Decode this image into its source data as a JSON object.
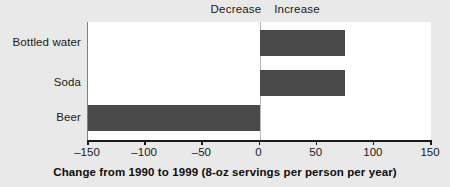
{
  "chart_data": {
    "type": "bar",
    "orientation": "horizontal",
    "title": "",
    "xlabel": "Change from 1990 to 1999 (8-oz servings per person per year)",
    "ylabel": "",
    "categories": [
      "Bottled water",
      "Soda",
      "Beer"
    ],
    "values": [
      75,
      75,
      -150
    ],
    "series": [
      {
        "name": "Change from 1990 to 1999",
        "values": [
          75,
          75,
          -150
        ]
      }
    ],
    "xlim": [
      -150,
      150
    ],
    "xticks": [
      -150,
      -100,
      -50,
      0,
      50,
      100,
      150
    ],
    "xtick_labels": [
      "–150",
      "–100",
      "–50",
      "0",
      "50",
      "100",
      "150"
    ],
    "grid": false,
    "legend": false,
    "annotations": [
      {
        "text": "Decrease",
        "side": "left",
        "position": "top"
      },
      {
        "text": "Increase",
        "side": "right",
        "position": "top"
      }
    ],
    "zero_reference_line": 0,
    "colors": {
      "bar": "#4a4a4a",
      "plot_background": "#ffffff",
      "figure_background": "#e9e9e9",
      "axis": "#1a1a1a",
      "zero_line": "#b9b9b9",
      "text": "#1a1a1a"
    }
  },
  "annotations": {
    "decrease": "Decrease",
    "increase": "Increase"
  },
  "axis": {
    "title": "Change from 1990 to 1999 (8-oz servings per person per year)",
    "ticks": [
      {
        "label": "–150"
      },
      {
        "label": "–100"
      },
      {
        "label": "–50"
      },
      {
        "label": "0"
      },
      {
        "label": "50"
      },
      {
        "label": "100"
      },
      {
        "label": "150"
      }
    ]
  },
  "categories": [
    {
      "label": "Bottled water"
    },
    {
      "label": "Soda"
    },
    {
      "label": "Beer"
    }
  ]
}
